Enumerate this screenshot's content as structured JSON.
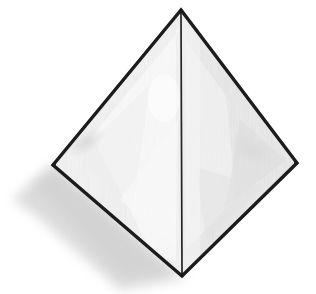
{
  "scene": {
    "title": "Tetrahedron line drawing",
    "object_name": "tetrahedron",
    "alt_text": "Hand-drawn tetrahedron (triangular pyramid) shown in three-quarter view with two shaded visible faces and a soft grey drop shadow to the lower left.",
    "canvas": {
      "width": 316,
      "height": 294,
      "background_color": "#ffffff"
    }
  },
  "geometry": {
    "vertices": {
      "apex": {
        "label": "apex",
        "x": 181,
        "y": 10
      },
      "left": {
        "label": "left base corner",
        "x": 53,
        "y": 165
      },
      "right": {
        "label": "right base corner",
        "x": 297,
        "y": 163
      },
      "front": {
        "label": "front base corner",
        "x": 182,
        "y": 276
      }
    },
    "outline_points": "181,10 53,165 182,276 297,163",
    "left_face_points": "181,10 53,165 182,276",
    "right_face_points": "181,10 297,163 182,276",
    "center_edge": {
      "x1": 181,
      "y1": 10,
      "x2": 182,
      "y2": 276
    },
    "shadow_points": "53,165 14,200 40,214 118,288 182,276"
  },
  "style": {
    "outline_color": "#1c1c1c",
    "outline_width": 3.4,
    "center_edge_color": "#242424",
    "center_edge_width": 1.7,
    "left_face_color": "#f4f4f4",
    "left_face_highlight_color": "#fcfcfc",
    "right_face_color": "#e9e9e9",
    "right_face_shade_color": "#dedede",
    "shadow_color": "#d9d9d9",
    "shadow_opacity": 0.85,
    "smudge_color": "#cfcfcf"
  }
}
